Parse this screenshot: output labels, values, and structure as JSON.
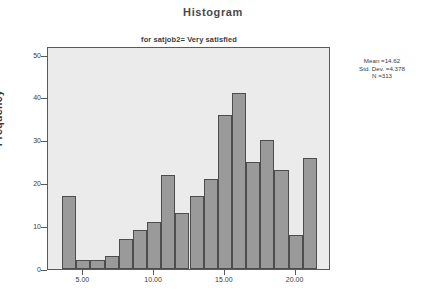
{
  "title": "Histogram",
  "subtitle": "for satjob2= Very satisfied",
  "axes": {
    "ylabel": "Frequency",
    "y_ticks": [
      "0",
      "10",
      "20",
      "30",
      "40",
      "50"
    ],
    "x_ticks": [
      "5.00",
      "10.00",
      "15.00",
      "20.00"
    ]
  },
  "stats": {
    "mean": "Mean =14.62",
    "std_dev": "Std. Dev. =4.378",
    "n": "N =313"
  },
  "colors": {
    "bar_fill": "#9a9a9a",
    "bar_border": "#4d4d4d",
    "plot_background": "#ebebeb",
    "frame": "#5a5a5a",
    "text": "#3a3a3a"
  },
  "chart_data": {
    "type": "bar",
    "title": "Histogram",
    "subtitle": "for satjob2= Very satisfied",
    "xlabel": "",
    "ylabel": "Frequency",
    "xlim": [
      2.5,
      22.5
    ],
    "ylim": [
      0,
      52
    ],
    "grid": false,
    "legend": "none",
    "bin_width": 1,
    "categories": [
      4,
      5,
      6,
      7,
      8,
      9,
      10,
      11,
      12,
      13,
      14,
      15,
      16,
      17,
      18,
      19,
      20,
      21
    ],
    "values": [
      17,
      2,
      2,
      3,
      7,
      9,
      11,
      22,
      13,
      17,
      21,
      36,
      41,
      25,
      30,
      23,
      8,
      26
    ],
    "annotations": [
      "Mean =14.62",
      "Std. Dev. =4.378",
      "N =313"
    ]
  }
}
